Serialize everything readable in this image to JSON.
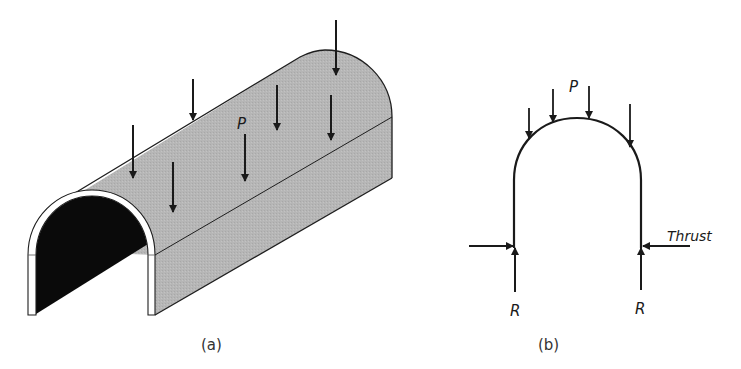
{
  "figure": {
    "panel_a": {
      "caption": "(a)",
      "load_label": "P",
      "description": "3D barrel vault / tunnel shell under distributed vertical loads",
      "colors": {
        "shell_fill": "#b4b4b4",
        "interior": "#0a0a0a",
        "edge": "#1e1e1e",
        "rim": "#ffffff"
      },
      "arrow_count": 7
    },
    "panel_b": {
      "caption": "(b)",
      "load_label": "P",
      "reaction_left_label": "R",
      "reaction_right_label": "R",
      "thrust_label": "Thrust",
      "description": "Cross-section of arch with vertical loads, vertical reactions and horizontal thrust",
      "arrow_count": 4
    }
  }
}
